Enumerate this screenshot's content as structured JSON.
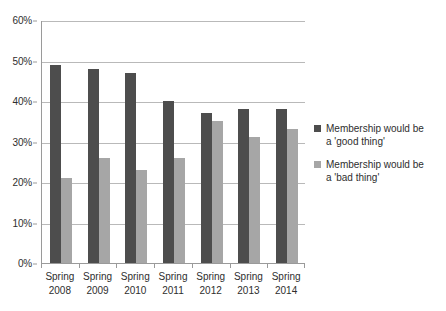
{
  "chart_data": {
    "type": "bar",
    "title": "",
    "subtitle": "",
    "xlabel": "",
    "ylabel": "",
    "categories": [
      "Spring 2008",
      "Spring 2009",
      "Spring 2010",
      "Spring 2011",
      "Spring 2012",
      "Spring 2013",
      "Spring 2014"
    ],
    "category_lines": [
      [
        "Spring",
        "2008"
      ],
      [
        "Spring",
        "2009"
      ],
      [
        "Spring",
        "2010"
      ],
      [
        "Spring",
        "2011"
      ],
      [
        "Spring",
        "2012"
      ],
      [
        "Spring",
        "2013"
      ],
      [
        "Spring",
        "2014"
      ]
    ],
    "series": [
      {
        "name": "Membership would be a 'good thing'",
        "name_lines": [
          "Membership would be",
          "a 'good thing'"
        ],
        "color": "#4d4d4d",
        "values": [
          49,
          48,
          47,
          40,
          37,
          38,
          38
        ]
      },
      {
        "name": "Membership would be a 'bad thing'",
        "name_lines": [
          "Membership would be",
          "a 'bad thing'"
        ],
        "color": "#a6a6a6",
        "values": [
          21,
          26,
          23,
          26,
          35,
          31,
          33
        ]
      }
    ],
    "ylim": [
      0,
      60
    ],
    "ytick_values": [
      0,
      10,
      20,
      30,
      40,
      50,
      60
    ],
    "ytick_labels": [
      "0%",
      "10%",
      "20%",
      "30%",
      "40%",
      "50%",
      "60%"
    ],
    "value_unit": "%",
    "grid": true,
    "grid_axis": "y",
    "legend_position": "right",
    "plot_background": "#ffffff",
    "axis_color": "#9a9a9a",
    "grid_color": "#b9b9b9"
  }
}
